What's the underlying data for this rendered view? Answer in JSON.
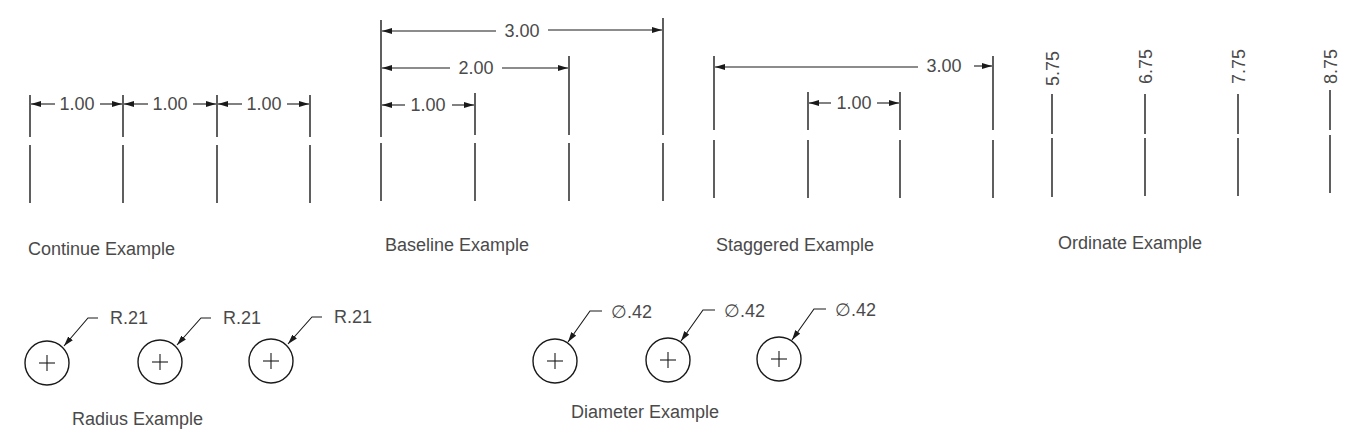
{
  "colors": {
    "line": "#1a1a1a",
    "text": "#4a4a4a",
    "background": "#ffffff"
  },
  "examples": {
    "continue": {
      "title": "Continue Example",
      "dims": [
        "1.00",
        "1.00",
        "1.00"
      ]
    },
    "baseline": {
      "title": "Baseline Example",
      "dims": [
        "3.00",
        "2.00",
        "1.00"
      ]
    },
    "staggered": {
      "title": "Staggered Example",
      "dims": [
        "3.00",
        "1.00"
      ]
    },
    "ordinate": {
      "title": "Ordinate Example",
      "dims": [
        "5.75",
        "6.75",
        "7.75",
        "8.75"
      ]
    },
    "radius": {
      "title": "Radius Example",
      "dims": [
        "R.21",
        "R.21",
        "R.21"
      ]
    },
    "diameter": {
      "title": "Diameter Example",
      "dims": [
        "∅.42",
        "∅.42",
        "∅.42"
      ]
    }
  }
}
